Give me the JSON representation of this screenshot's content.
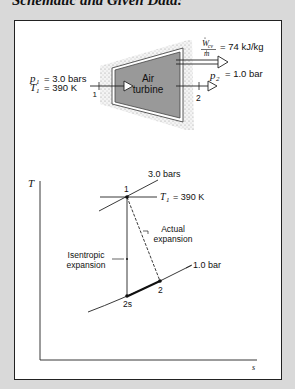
{
  "heading": "Schematic and Given Data:",
  "schematic": {
    "device_label_line1": "Air",
    "device_label_line2": "turbine",
    "inlet": {
      "p_symbol": "p",
      "p_sub": "1",
      "p_value": "= 3.0 bars",
      "T_symbol": "T",
      "T_sub": "1",
      "T_value": "= 390 K",
      "state_label": "1"
    },
    "outlet": {
      "p_symbol": "p",
      "p_sub": "2",
      "p_value": "= 1.0 bar",
      "state_label": "2"
    },
    "work": {
      "numerator": "W",
      "numerator_sub": "cv",
      "denominator": "m",
      "value": "= 74 kJ/kg"
    }
  },
  "ts_diagram": {
    "y_axis_label": "T",
    "x_axis_label": "s",
    "isobar_high_label": "3.0 bars",
    "isobar_low_label": "1.0 bar",
    "isotherm_label_symbol": "T",
    "isotherm_label_sub": "1",
    "isotherm_label_value": "= 390 K",
    "point_1_label": "1",
    "point_2_label": "2",
    "point_2s_label": "2s",
    "actual_label_line1": "Actual",
    "actual_label_line2": "expansion",
    "isentropic_label_line1": "Isentropic",
    "isentropic_label_line2": "expansion"
  }
}
